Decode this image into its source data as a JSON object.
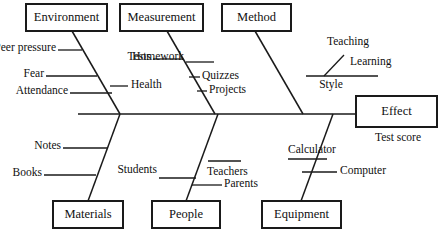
{
  "diagram": {
    "type": "fishbone-ishikawa",
    "title": "",
    "effect": {
      "box_label": "Effect",
      "sub_label": "Test score"
    },
    "categories": [
      {
        "id": "environment",
        "label": "Environment",
        "position": "top",
        "causes": [
          {
            "label": "Peer pressure",
            "side": "left"
          },
          {
            "label": "Fear",
            "side": "left"
          },
          {
            "label": "Attendance",
            "side": "left"
          }
        ]
      },
      {
        "id": "measurement",
        "label": "Measurement",
        "position": "top",
        "causes": [
          {
            "label": "Tests",
            "side": "left"
          },
          {
            "label": "Health",
            "side": "left"
          },
          {
            "label": "Homework",
            "side": "right"
          },
          {
            "label": "Quizzes",
            "side": "right"
          },
          {
            "label": "Projects",
            "side": "right"
          }
        ]
      },
      {
        "id": "method",
        "label": "Method",
        "position": "top",
        "causes": [
          {
            "label": "Style",
            "side": "right"
          },
          {
            "label": "Teaching",
            "side": "right",
            "parent": "Style"
          },
          {
            "label": "Learning",
            "side": "right",
            "parent": "Style"
          }
        ]
      },
      {
        "id": "materials",
        "label": "Materials",
        "position": "bottom",
        "causes": [
          {
            "label": "Notes",
            "side": "left"
          },
          {
            "label": "Books",
            "side": "left"
          }
        ]
      },
      {
        "id": "people",
        "label": "People",
        "position": "bottom",
        "causes": [
          {
            "label": "Students",
            "side": "left"
          },
          {
            "label": "Teachers",
            "side": "right"
          },
          {
            "label": "Parents",
            "side": "right"
          }
        ]
      },
      {
        "id": "equipment",
        "label": "Equipment",
        "position": "bottom",
        "causes": [
          {
            "label": "Calculator",
            "side": "left"
          },
          {
            "label": "Computer",
            "side": "right"
          }
        ]
      }
    ],
    "colors": {
      "line": "#1a1a1a",
      "text": "#101010",
      "background": "#ffffff"
    }
  }
}
